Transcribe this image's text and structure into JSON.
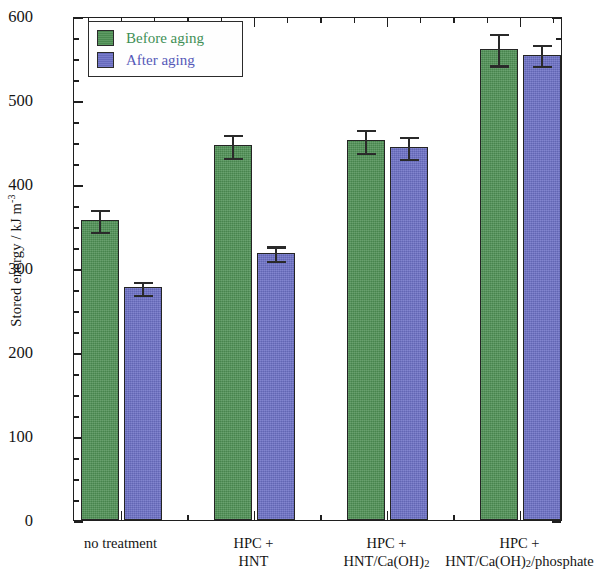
{
  "chart_data": {
    "type": "bar",
    "title": "",
    "xlabel": "",
    "ylabel": "Stored energy / kJ m",
    "ylabel_exponent": "-3",
    "ylim": [
      0,
      600
    ],
    "ytick_major_step": 100,
    "ytick_minor_step": 25,
    "yticks": [
      0,
      100,
      200,
      300,
      400,
      500,
      600
    ],
    "ytick_labels": [
      "0",
      "100",
      "200",
      "300",
      "400",
      "500",
      "600"
    ],
    "grid": false,
    "legend_position": "top-left",
    "categories": [
      "no treatment",
      "HPC + HNT",
      "HPC + HNT/Ca(OH)2",
      "HPC + HNT/Ca(OH)2/phosphate"
    ],
    "category_label_lines": [
      [
        "no treatment",
        ""
      ],
      [
        "HPC +",
        "HNT"
      ],
      [
        "HPC +",
        "HNT/Ca(OH)",
        "2"
      ],
      [
        "HPC +",
        "HNT/Ca(OH)",
        "2",
        "/phosphate"
      ]
    ],
    "series": [
      {
        "name": "Before aging",
        "color": "#4f9155",
        "text_color": "#3f8f55",
        "values": [
          357,
          446,
          452,
          561
        ],
        "errors": [
          14,
          15,
          15,
          20
        ]
      },
      {
        "name": "After aging",
        "color": "#6c70c6",
        "text_color": "#5659b8",
        "values": [
          277,
          318,
          444,
          554
        ],
        "errors": [
          9,
          10,
          14,
          14
        ]
      }
    ]
  },
  "legend": {
    "items": [
      {
        "label": "Before aging",
        "swatch": "before"
      },
      {
        "label": "After aging",
        "swatch": "after"
      }
    ]
  },
  "axis": {
    "y_title_main": "Stored energy / kJ m",
    "y_title_sup": "-3"
  }
}
